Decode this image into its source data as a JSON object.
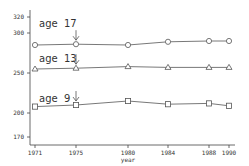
{
  "chart_data": {
    "type": "line",
    "title": "",
    "xlabel": "year",
    "ylabel": "",
    "x": [
      1971,
      1975,
      1980,
      1984,
      1988,
      1990
    ],
    "x_tick_labels": [
      "1971",
      "1975",
      "1980",
      "1984",
      "1988",
      "1990"
    ],
    "y_ticks": [
      170,
      200,
      250,
      300,
      320
    ],
    "y_tick_labels": [
      "170",
      "200",
      "250",
      "300",
      "320"
    ],
    "ylim": [
      165,
      325
    ],
    "grid": false,
    "legend": null,
    "series": [
      {
        "name": "age 17",
        "marker": "circle",
        "values": [
          285,
          286,
          285,
          289,
          290,
          290
        ]
      },
      {
        "name": "age 13",
        "marker": "triangle",
        "values": [
          255,
          256,
          258,
          257,
          257,
          257
        ]
      },
      {
        "name": "age 9",
        "marker": "square",
        "values": [
          208,
          210,
          215,
          211,
          212,
          209
        ]
      }
    ],
    "annotations": [
      {
        "text": "age 17",
        "arrow_at_x": 1975,
        "series": "age 17"
      },
      {
        "text": "age 13",
        "arrow_at_x": 1975,
        "series": "age 13"
      },
      {
        "text": "age 9",
        "arrow_at_x": 1975,
        "series": "age 9"
      }
    ],
    "colors": {
      "line": "#555555",
      "axis": "#444444",
      "text": "#333333"
    }
  }
}
